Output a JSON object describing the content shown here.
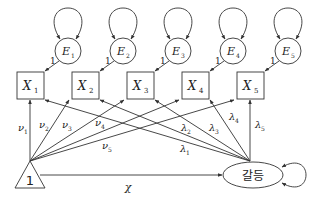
{
  "diagram": {
    "type": "latent-growth / structural equation path diagram",
    "observed": [
      {
        "id": "X1",
        "base": "X",
        "sub": "1"
      },
      {
        "id": "X2",
        "base": "X",
        "sub": "2"
      },
      {
        "id": "X3",
        "base": "X",
        "sub": "3"
      },
      {
        "id": "X4",
        "base": "X",
        "sub": "4"
      },
      {
        "id": "X5",
        "base": "X",
        "sub": "5"
      }
    ],
    "errors": [
      {
        "id": "E1",
        "base": "E",
        "sub": "1",
        "loading": "1"
      },
      {
        "id": "E2",
        "base": "E",
        "sub": "2",
        "loading": "1"
      },
      {
        "id": "E3",
        "base": "E",
        "sub": "3",
        "loading": "1"
      },
      {
        "id": "E4",
        "base": "E",
        "sub": "4",
        "loading": "1"
      },
      {
        "id": "E5",
        "base": "E",
        "sub": "5",
        "loading": "1"
      }
    ],
    "constant": {
      "label": "1"
    },
    "latent": {
      "label": "갈등"
    },
    "intercepts": [
      {
        "base": "ν",
        "sub": "1"
      },
      {
        "base": "ν",
        "sub": "2"
      },
      {
        "base": "ν",
        "sub": "3"
      },
      {
        "base": "ν",
        "sub": "4"
      },
      {
        "base": "ν",
        "sub": "5"
      }
    ],
    "loadings": [
      {
        "base": "λ",
        "sub": "1"
      },
      {
        "base": "λ",
        "sub": "2"
      },
      {
        "base": "λ",
        "sub": "3"
      },
      {
        "base": "λ",
        "sub": "4"
      },
      {
        "base": "λ",
        "sub": "5"
      }
    ],
    "mean_path": {
      "label": "χ"
    },
    "colors": {
      "line": "#333333",
      "text": "#222222",
      "background": "#ffffff"
    }
  }
}
